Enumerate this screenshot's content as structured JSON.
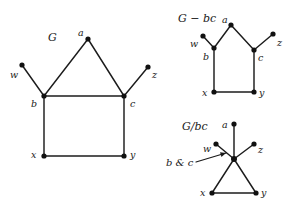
{
  "figure": {
    "background_color": "#ffffff",
    "ink_color": "#1a1a1a",
    "width": 294,
    "height": 216
  },
  "panels": [
    {
      "id": "graph-g",
      "title": "G",
      "title_pos": {
        "x": 48,
        "y": 32
      },
      "vertices": [
        {
          "id": "a",
          "label": "a",
          "x": 88,
          "y": 39,
          "label_x": 78,
          "label_y": 28
        },
        {
          "id": "w",
          "label": "w",
          "x": 22,
          "y": 65,
          "label_x": 10,
          "label_y": 70
        },
        {
          "id": "z",
          "label": "z",
          "x": 148,
          "y": 67,
          "label_x": 152,
          "label_y": 70
        },
        {
          "id": "b",
          "label": "b",
          "x": 44,
          "y": 96,
          "label_x": 31,
          "label_y": 99
        },
        {
          "id": "c",
          "label": "c",
          "x": 124,
          "y": 96,
          "label_x": 130,
          "label_y": 99
        },
        {
          "id": "x",
          "label": "x",
          "x": 44,
          "y": 156,
          "label_x": 31,
          "label_y": 150
        },
        {
          "id": "y",
          "label": "y",
          "x": 124,
          "y": 156,
          "label_x": 130,
          "label_y": 150
        }
      ],
      "edges": [
        [
          "a",
          "b"
        ],
        [
          "a",
          "c"
        ],
        [
          "w",
          "b"
        ],
        [
          "z",
          "c"
        ],
        [
          "b",
          "c"
        ],
        [
          "b",
          "x"
        ],
        [
          "c",
          "y"
        ],
        [
          "x",
          "y"
        ]
      ]
    },
    {
      "id": "graph-g-minus-bc",
      "title": "G − bc",
      "title_pos": {
        "x": 178,
        "y": 13
      },
      "vertices": [
        {
          "id": "a",
          "label": "a",
          "x": 231,
          "y": 25,
          "label_x": 222,
          "label_y": 15
        },
        {
          "id": "w",
          "label": "w",
          "x": 203,
          "y": 36,
          "label_x": 190,
          "label_y": 39
        },
        {
          "id": "z",
          "label": "z",
          "x": 273,
          "y": 34,
          "label_x": 277,
          "label_y": 38
        },
        {
          "id": "b",
          "label": "b",
          "x": 214,
          "y": 48,
          "label_x": 203,
          "label_y": 52
        },
        {
          "id": "c",
          "label": "c",
          "x": 254,
          "y": 50,
          "label_x": 258,
          "label_y": 53
        },
        {
          "id": "x",
          "label": "x",
          "x": 214,
          "y": 92,
          "label_x": 202,
          "label_y": 88
        },
        {
          "id": "y",
          "label": "y",
          "x": 254,
          "y": 92,
          "label_x": 259,
          "label_y": 88
        }
      ],
      "edges": [
        [
          "a",
          "b"
        ],
        [
          "a",
          "c"
        ],
        [
          "w",
          "b"
        ],
        [
          "z",
          "c"
        ],
        [
          "b",
          "x"
        ],
        [
          "c",
          "y"
        ],
        [
          "x",
          "y"
        ]
      ]
    },
    {
      "id": "graph-g-contract-bc",
      "title": "G/bc",
      "title_pos": {
        "x": 182,
        "y": 121
      },
      "merged_label": "b & c",
      "merged_label_pos": {
        "x": 166,
        "y": 158
      },
      "arrow": {
        "x1": 196,
        "y1": 162,
        "x2": 226,
        "y2": 153
      },
      "vertices": [
        {
          "id": "a",
          "label": "a",
          "x": 234,
          "y": 124,
          "label_x": 222,
          "label_y": 120
        },
        {
          "id": "w",
          "label": "w",
          "x": 216,
          "y": 144,
          "label_x": 203,
          "label_y": 144
        },
        {
          "id": "z",
          "label": "z",
          "x": 254,
          "y": 144,
          "label_x": 258,
          "label_y": 145
        },
        {
          "id": "bc",
          "label": "",
          "x": 234,
          "y": 159,
          "label_x": 0,
          "label_y": 0
        },
        {
          "id": "x",
          "label": "x",
          "x": 212,
          "y": 193,
          "label_x": 200,
          "label_y": 188
        },
        {
          "id": "y",
          "label": "y",
          "x": 256,
          "y": 193,
          "label_x": 261,
          "label_y": 188
        }
      ],
      "edges": [
        [
          "a",
          "bc"
        ],
        [
          "w",
          "bc"
        ],
        [
          "z",
          "bc"
        ],
        [
          "bc",
          "x"
        ],
        [
          "bc",
          "y"
        ],
        [
          "x",
          "y"
        ]
      ]
    }
  ]
}
